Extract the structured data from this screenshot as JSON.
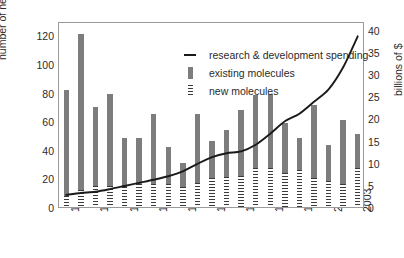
{
  "chart_data": {
    "type": "bar",
    "title": "",
    "xlabel": "",
    "ylabel": "number of new products",
    "y2label": "billions of $",
    "grid": false,
    "legend_position": "top-center-inside",
    "ylim": [
      0,
      130
    ],
    "y2lim": [
      0,
      42
    ],
    "yticks": [
      0,
      20,
      40,
      60,
      80,
      100,
      120
    ],
    "y2ticks": [
      0,
      5,
      10,
      15,
      20,
      25,
      30,
      35,
      40
    ],
    "categories": [
      "1983",
      "1984",
      "1985",
      "1986",
      "1987",
      "1988",
      "1989",
      "1990",
      "1991",
      "1992",
      "1993",
      "1994",
      "1995",
      "1996",
      "1997",
      "1998",
      "1999",
      "2000",
      "2001",
      "2002",
      "2003"
    ],
    "xtick_labels": [
      "1983",
      "",
      "1985",
      "",
      "1987",
      "",
      "1989",
      "",
      "1991",
      "",
      "1993",
      "",
      "1995",
      "",
      "1997",
      "",
      "1999",
      "",
      "2001",
      "",
      "2003"
    ],
    "series": [
      {
        "name": "existing molecules",
        "type": "bar",
        "axis": "left",
        "color": "#7d7d7d",
        "values": [
          82,
          121,
          70,
          79,
          48,
          48,
          65,
          42,
          31,
          65,
          46,
          54,
          68,
          78,
          79,
          59,
          48,
          71,
          43,
          61,
          51
        ]
      },
      {
        "name": "new molecules",
        "type": "bar-overlay",
        "axis": "left",
        "color": "#3a3a3a",
        "values": [
          8,
          12,
          15,
          15,
          14,
          16,
          16,
          16,
          14,
          17,
          20,
          21,
          22,
          27,
          27,
          24,
          26,
          20,
          18,
          16,
          27
        ]
      },
      {
        "name": "research & development spending",
        "type": "line",
        "axis": "right",
        "color": "#1a1a1a",
        "values": [
          3.2,
          3.6,
          3.9,
          4.5,
          5.2,
          5.9,
          6.6,
          7.4,
          8.5,
          10.2,
          11.7,
          12.6,
          13.0,
          14.5,
          17.0,
          19.8,
          21.5,
          24.2,
          27.0,
          32.0,
          39.0
        ]
      }
    ],
    "legend": [
      {
        "icon": "line-swatch",
        "label": "research & development spending"
      },
      {
        "icon": "bar-swatch",
        "label": "existing molecules"
      },
      {
        "icon": "dashed-bar-swatch",
        "label": "new molecules"
      }
    ]
  }
}
